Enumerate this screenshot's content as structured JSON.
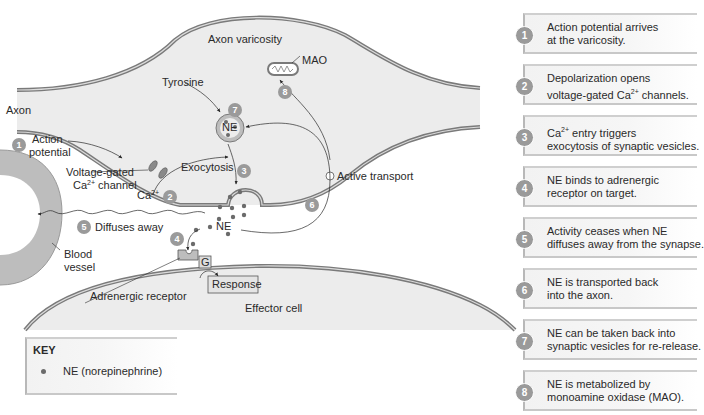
{
  "labels": {
    "axon": "Axon",
    "axon_varicosity": "Axon varicosity",
    "mao": "MAO",
    "tyrosine": "Tyrosine",
    "ne_vesicle": "NE",
    "action_potential_line1": "Action",
    "action_potential_line2": "potential",
    "voltage_gated_line1": "Voltage-gated",
    "voltage_gated_line2_base": "Ca",
    "voltage_gated_line2_sup": "2+",
    "voltage_gated_line2_rest": " channel",
    "ca_base": "Ca",
    "ca_sup": "2+",
    "exocytosis": "Exocytosis",
    "active_transport": "Active transport",
    "diffuses_away": "Diffuses away",
    "ne_cleft": "NE",
    "blood_vessel_line1": "Blood",
    "blood_vessel_line2": "vessel",
    "g_protein": "G",
    "response": "Response",
    "adrenergic_receptor": "Adrenergic receptor",
    "effector_cell": "Effector cell"
  },
  "badges": {
    "b1": "1",
    "b2": "2",
    "b3": "3",
    "b4": "4",
    "b5": "5",
    "b6": "6",
    "b7": "7",
    "b8": "8"
  },
  "steps": [
    {
      "num": "1",
      "line1": "Action potential arrives",
      "line2": "at the varicosity."
    },
    {
      "num": "2",
      "line1": "Depolarization opens",
      "line2_pre": "voltage-gated Ca",
      "line2_sup": "2+",
      "line2_post": " channels."
    },
    {
      "num": "3",
      "line1_pre": "Ca",
      "line1_sup": "2+",
      "line1_post": " entry triggers",
      "line2": "exocytosis of synaptic vesicles."
    },
    {
      "num": "4",
      "line1": "NE binds to adrenergic",
      "line2": "receptor on target."
    },
    {
      "num": "5",
      "line1": "Activity ceases when NE",
      "line2": "diffuses away from the synapse."
    },
    {
      "num": "6",
      "line1": "NE is transported back",
      "line2": "into the axon."
    },
    {
      "num": "7",
      "line1": "NE can be taken back into",
      "line2": "synaptic vesicles for re-release."
    },
    {
      "num": "8",
      "line1": "NE is metabolized by",
      "line2": "monoamine oxidase (MAO)."
    }
  ],
  "key": {
    "title": "KEY",
    "item": "NE (norepinephrine)"
  },
  "colors": {
    "membrane": "#7a7a7a",
    "cytoplasm": "#ececec",
    "badge": "#9a9a9a",
    "ne_dot": "#6b6b6b"
  }
}
